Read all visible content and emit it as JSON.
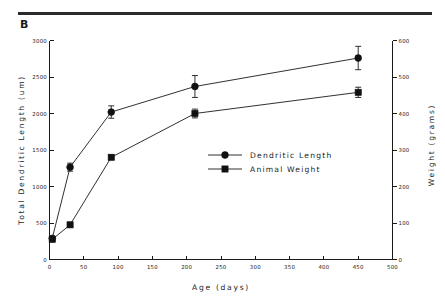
{
  "figure": {
    "panel_label": "B",
    "divider": "horizontal-rule"
  },
  "chart_data": {
    "type": "line",
    "title": "",
    "xlabel": "Age  (days)",
    "ylabel": "Total Dendritic Length  (um)",
    "y2label": "Weight (grams)",
    "xlim": [
      0,
      500
    ],
    "ylim": [
      0,
      3000
    ],
    "y2lim": [
      0,
      600
    ],
    "xticks": [
      0,
      50,
      100,
      150,
      200,
      250,
      300,
      350,
      400,
      450,
      500
    ],
    "xticklabels": [
      "0",
      "50",
      "100",
      "150",
      "200",
      "250",
      "300",
      "350",
      "400",
      "450",
      "500"
    ],
    "yticks": [
      0,
      500,
      1000,
      1500,
      2000,
      2500,
      3000
    ],
    "yticklabels": [
      "0",
      "500",
      "1000",
      "1500",
      "2000",
      "2500",
      "3000"
    ],
    "y2ticks": [
      0,
      100,
      200,
      300,
      400,
      500,
      600
    ],
    "y2ticklabels": [
      "0",
      "100",
      "200",
      "300",
      "400",
      "500",
      "600"
    ],
    "grid": false,
    "legend_position": "center-right",
    "series": [
      {
        "name": "Dendritic Length",
        "marker": "circle",
        "axis": "left",
        "x": [
          4,
          30,
          90,
          212,
          450
        ],
        "values": [
          290,
          1265,
          2020,
          2370,
          2760
        ],
        "errors": [
          30,
          55,
          85,
          150,
          160
        ]
      },
      {
        "name": "Animal Weight",
        "marker": "square",
        "axis": "right",
        "x": [
          4,
          30,
          90,
          212,
          450
        ],
        "values": [
          55,
          95,
          280,
          400,
          458
        ],
        "errors": [
          4,
          5,
          6,
          12,
          14
        ]
      }
    ],
    "legend": [
      {
        "label": "Dendritic Length",
        "marker": "circle"
      },
      {
        "label": "Animal Weight",
        "marker": "square"
      }
    ]
  }
}
